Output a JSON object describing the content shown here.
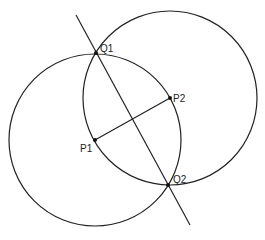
{
  "diagram": {
    "stroke_color": "#222222",
    "background": "#ffffff",
    "points": {
      "P1": {
        "label": "P1",
        "x": 95,
        "y": 140
      },
      "P2": {
        "label": "P2",
        "x": 170,
        "y": 98
      },
      "Q1": {
        "label": "Q1",
        "x": 96,
        "y": 53
      },
      "Q2": {
        "label": "Q2",
        "x": 168,
        "y": 185
      }
    },
    "circles": [
      {
        "name": "circle-centered-P1",
        "cx": 95,
        "cy": 140,
        "r": 86
      },
      {
        "name": "circle-centered-P2",
        "cx": 170,
        "cy": 98,
        "r": 87
      }
    ],
    "segments": [
      {
        "name": "segment-P1-P2",
        "x1": 95,
        "y1": 140,
        "x2": 170,
        "y2": 98
      },
      {
        "name": "bisector-line",
        "x1": 76,
        "y1": 15,
        "x2": 190,
        "y2": 225
      }
    ]
  }
}
